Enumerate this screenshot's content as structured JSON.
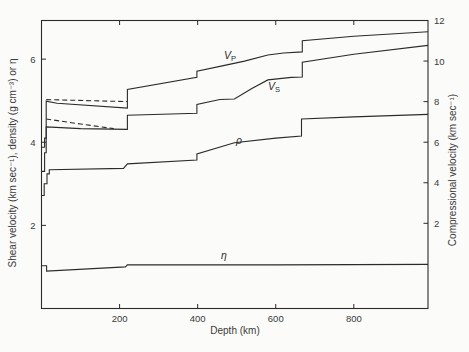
{
  "chart_data": {
    "type": "line",
    "title": "",
    "x_axis": {
      "title": "Depth (km)",
      "min": 0,
      "max": 990,
      "ticks": [
        200,
        400,
        600,
        800
      ]
    },
    "left_axis": {
      "title": "Shear velocity (km sec⁻¹), density (g cm⁻³) or η",
      "min": 0,
      "max": 6.93,
      "ticks": [
        2,
        4,
        6
      ]
    },
    "right_axis": {
      "title": "Compressional velocity (km sec⁻¹)",
      "min": -2.2,
      "max": 12,
      "ticks": [
        2,
        4,
        6,
        8,
        10,
        12
      ]
    },
    "grid": false,
    "legend": "none",
    "series": [
      {
        "name": "compressional-velocity-Vp",
        "axis": "right",
        "line": "solid",
        "points": [
          [
            0,
            5.75
          ],
          [
            8,
            5.75
          ],
          [
            8,
            6.2
          ],
          [
            12,
            6.2
          ],
          [
            12,
            8.02
          ],
          [
            40,
            7.92
          ],
          [
            220,
            7.68
          ],
          [
            220,
            8.6
          ],
          [
            398,
            9.2
          ],
          [
            398,
            9.5
          ],
          [
            460,
            9.75
          ],
          [
            520,
            10.0
          ],
          [
            580,
            10.3
          ],
          [
            620,
            10.4
          ],
          [
            668,
            10.45
          ],
          [
            668,
            11.0
          ],
          [
            800,
            11.22
          ],
          [
            990,
            11.45
          ]
        ]
      },
      {
        "name": "compressional-velocity-Vp-alternate",
        "axis": "right",
        "line": "dashed",
        "points": [
          [
            12,
            8.1
          ],
          [
            220,
            8.0
          ]
        ]
      },
      {
        "name": "shear-velocity-Vs",
        "axis": "left",
        "line": "solid",
        "points": [
          [
            0,
            3.3
          ],
          [
            8,
            3.3
          ],
          [
            8,
            3.75
          ],
          [
            12,
            3.75
          ],
          [
            12,
            4.37
          ],
          [
            100,
            4.33
          ],
          [
            220,
            4.31
          ],
          [
            220,
            4.65
          ],
          [
            398,
            4.7
          ],
          [
            398,
            4.91
          ],
          [
            457,
            5.03
          ],
          [
            494,
            5.04
          ],
          [
            540,
            5.3
          ],
          [
            580,
            5.5
          ],
          [
            640,
            5.56
          ],
          [
            668,
            5.57
          ],
          [
            668,
            5.93
          ],
          [
            800,
            6.12
          ],
          [
            990,
            6.33
          ]
        ]
      },
      {
        "name": "shear-velocity-Vs-alternate",
        "axis": "left",
        "line": "dashed",
        "points": [
          [
            12,
            4.56
          ],
          [
            100,
            4.44
          ],
          [
            185,
            4.33
          ]
        ]
      },
      {
        "name": "density-rho",
        "axis": "left",
        "line": "solid",
        "points": [
          [
            0,
            2.72
          ],
          [
            7,
            2.72
          ],
          [
            7,
            3.0
          ],
          [
            14,
            3.0
          ],
          [
            14,
            3.24
          ],
          [
            20,
            3.24
          ],
          [
            20,
            3.34
          ],
          [
            210,
            3.37
          ],
          [
            220,
            3.48
          ],
          [
            398,
            3.57
          ],
          [
            398,
            3.72
          ],
          [
            494,
            3.99
          ],
          [
            600,
            4.1
          ],
          [
            666,
            4.15
          ],
          [
            666,
            4.56
          ],
          [
            800,
            4.61
          ],
          [
            990,
            4.67
          ]
        ]
      },
      {
        "name": "eta",
        "axis": "left",
        "line": "solid",
        "points": [
          [
            0,
            1.03
          ],
          [
            13,
            1.03
          ],
          [
            13,
            0.9
          ],
          [
            215,
            1.0
          ],
          [
            220,
            1.05
          ],
          [
            600,
            1.05
          ],
          [
            990,
            1.06
          ]
        ]
      }
    ],
    "annotations": [
      {
        "id": "vp-label",
        "text_main": "V",
        "text_sub": "P",
        "x_px": 224,
        "y_px": 49
      },
      {
        "id": "vs-label",
        "text_main": "V",
        "text_sub": "S",
        "x_px": 268,
        "y_px": 80
      },
      {
        "id": "rho-label",
        "text": "ρ",
        "x_px": 236,
        "y_px": 134
      },
      {
        "id": "eta-label",
        "text": "η",
        "x_px": 221,
        "y_px": 249
      }
    ],
    "colors": {
      "line": "#2b2b2b",
      "text": "#3a3a3a",
      "background": "#fbfbf9"
    }
  }
}
